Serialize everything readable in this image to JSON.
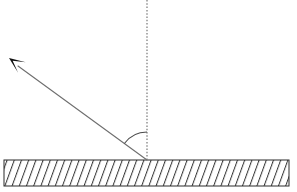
{
  "canvas": {
    "width": 297,
    "height": 192,
    "background_color": "#ffffff"
  },
  "diagram": {
    "type": "optics-ray-diagram",
    "surface": {
      "name": "hatched-surface-bar",
      "x": 4,
      "y": 160,
      "width": 285,
      "height": 26,
      "border_color": "#2b2b2b",
      "border_width": 1,
      "fill_color": "#ffffff",
      "hatch": {
        "direction": "forward-slash",
        "angle_deg": 70,
        "spacing": 7.2,
        "line_color": "#3a3a3a",
        "line_width": 1.1,
        "count": 40
      }
    },
    "normal_line": {
      "name": "normal-dotted-line",
      "x": 147,
      "y_top": 0,
      "y_bottom": 160,
      "color": "#8a8a8a",
      "width": 1.4,
      "dash_pattern": "1.5 1.8",
      "style": "dotted"
    },
    "incident_ray": {
      "name": "incident-ray-line",
      "from_x": 147,
      "from_y": 160,
      "to_x": 18,
      "to_y": 66,
      "color": "#6e6e6e",
      "width": 1.1,
      "direction": "outgoing-up-left"
    },
    "arrowhead": {
      "name": "ray-arrowhead",
      "tip_x": 9,
      "tip_y": 58,
      "length": 16,
      "half_width": 6.5,
      "notch": 4.5,
      "fill_color": "#111111",
      "angle_deg": 216
    },
    "angle_arc": {
      "name": "angle-of-incidence-arc",
      "center_x": 147,
      "center_y": 160,
      "radius": 28,
      "start_angle_deg": 180,
      "end_angle_deg": 216,
      "color": "#4a4a4a",
      "width": 1.1,
      "label": ""
    }
  }
}
